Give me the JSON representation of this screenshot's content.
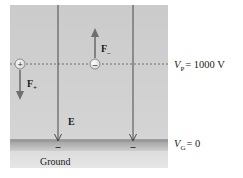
{
  "diagram": {
    "panel": {
      "x": 10,
      "y": 5,
      "width": 158,
      "height": 163,
      "color_top": "#c9c9c9",
      "color_bottom": "#e2e2e2"
    },
    "field_lines": [
      {
        "x": 58,
        "y_start": 5,
        "y_end": 141
      },
      {
        "x": 133,
        "y_start": 5,
        "y_end": 141
      }
    ],
    "field_label": "E",
    "equipotential": {
      "y": 64,
      "label_symbol": "V",
      "label_subscript": "P",
      "label_value": "= 1000 V"
    },
    "ground_plane": {
      "y": 141,
      "height": 10,
      "label_symbol": "V",
      "label_subscript": "G",
      "label_value": "= 0",
      "name": "Ground",
      "color": "#a8a8a8"
    },
    "ground_charges": [
      {
        "x": 58,
        "sign": "–"
      },
      {
        "x": 133,
        "sign": "–"
      }
    ],
    "charges": [
      {
        "id": "positive",
        "x": 20,
        "y": 64,
        "sign": "+",
        "force_label": "F",
        "force_subscript": "+",
        "force_direction": "down",
        "arrow_end_y": 100
      },
      {
        "id": "negative",
        "x": 95,
        "y": 64,
        "sign": "–",
        "force_label": "F",
        "force_subscript": "–",
        "force_direction": "up",
        "arrow_end_y": 28
      }
    ],
    "colors": {
      "arrow": "#6e6e6e",
      "line": "#3a3a3a",
      "charge_fill": "#f2f2f2",
      "charge_stroke": "#7a7a7a"
    }
  }
}
